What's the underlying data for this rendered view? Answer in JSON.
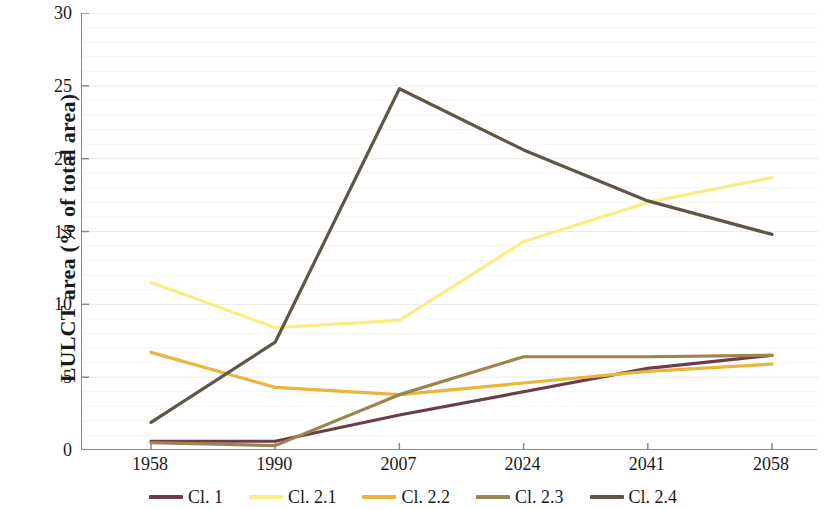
{
  "chart_data": {
    "type": "line",
    "title": "",
    "xlabel": "",
    "ylabel": "LULCT area (% of total area)",
    "categories": [
      "1958",
      "1990",
      "2007",
      "2024",
      "2041",
      "2058"
    ],
    "x": [
      1958,
      1990,
      2007,
      2024,
      2041,
      2058
    ],
    "ylim": [
      0,
      30
    ],
    "yticks": [
      0,
      5,
      10,
      15,
      20,
      25,
      30
    ],
    "ytick_labels": [
      "0",
      "5",
      "10",
      "15",
      "20",
      "25",
      "30"
    ],
    "grid": true,
    "legend_position": "bottom",
    "series": [
      {
        "name": "Cl. 1",
        "color": "#6b3d4a",
        "values": [
          0.6,
          0.6,
          2.4,
          4.0,
          5.6,
          6.5
        ]
      },
      {
        "name": "Cl. 2.1",
        "color": "#f7ef86",
        "values": [
          11.5,
          8.4,
          8.9,
          14.3,
          17.0,
          18.7
        ]
      },
      {
        "name": "Cl. 2.2",
        "color": "#e9b53c",
        "values": [
          6.7,
          4.3,
          3.8,
          4.6,
          5.4,
          5.9
        ]
      },
      {
        "name": "Cl. 2.3",
        "color": "#9b8352",
        "values": [
          0.5,
          0.3,
          3.8,
          6.4,
          6.4,
          6.5
        ]
      },
      {
        "name": "Cl. 2.4",
        "color": "#5f5648",
        "values": [
          1.9,
          7.4,
          24.8,
          20.6,
          17.1,
          14.8
        ]
      }
    ]
  },
  "axes": {
    "y_title": "LULCT area (% of total area)",
    "axis_color": "#8a8a8a",
    "grid_color": "#eceae4"
  }
}
